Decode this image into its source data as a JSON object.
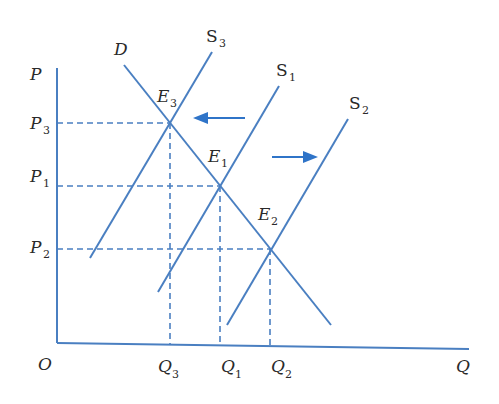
{
  "colors": {
    "line": "#4a7fc1",
    "arrow": "#2f74c8",
    "text": "#2a2a2a"
  },
  "diagram": {
    "type": "supply-demand",
    "axes": {
      "y_label": "P",
      "x_label": "Q",
      "origin_label": "O"
    },
    "curves": {
      "demand": {
        "label": "D"
      },
      "supply_3": {
        "label": "S",
        "sub": "3"
      },
      "supply_1": {
        "label": "S",
        "sub": "1"
      },
      "supply_2": {
        "label": "S",
        "sub": "2"
      }
    },
    "equilibria": [
      {
        "id": "E3",
        "label": "E",
        "sub": "3"
      },
      {
        "id": "E1",
        "label": "E",
        "sub": "1"
      },
      {
        "id": "E2",
        "label": "E",
        "sub": "2"
      }
    ],
    "prices": [
      {
        "label": "P",
        "sub": "3"
      },
      {
        "label": "P",
        "sub": "1"
      },
      {
        "label": "P",
        "sub": "2"
      }
    ],
    "quantities": [
      {
        "label": "Q",
        "sub": "3"
      },
      {
        "label": "Q",
        "sub": "1"
      },
      {
        "label": "Q",
        "sub": "2"
      }
    ],
    "arrows": [
      {
        "direction": "left",
        "meaning": "supply decrease S1 to S3"
      },
      {
        "direction": "right",
        "meaning": "supply increase S1 to S2"
      }
    ]
  }
}
